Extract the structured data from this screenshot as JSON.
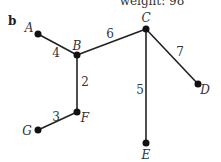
{
  "caption": "weight: 98",
  "panel_label": "b",
  "graph": {
    "nodes": [
      {
        "id": "A",
        "x": 38,
        "y": 34,
        "lx": 29,
        "ly": 32
      },
      {
        "id": "B",
        "x": 77,
        "y": 55,
        "lx": 77,
        "ly": 50
      },
      {
        "id": "C",
        "x": 146,
        "y": 29,
        "lx": 146,
        "ly": 22
      },
      {
        "id": "D",
        "x": 198,
        "y": 84,
        "lx": 205,
        "ly": 94
      },
      {
        "id": "E",
        "x": 146,
        "y": 143,
        "lx": 146,
        "ly": 159
      },
      {
        "id": "F",
        "x": 77,
        "y": 112,
        "lx": 85,
        "ly": 122
      },
      {
        "id": "G",
        "x": 38,
        "y": 130,
        "lx": 27,
        "ly": 135
      }
    ],
    "edges": [
      {
        "from": "A",
        "to": "B",
        "weight": "4",
        "wx": 56,
        "wy": 57
      },
      {
        "from": "B",
        "to": "C",
        "weight": "6",
        "wx": 110,
        "wy": 38
      },
      {
        "from": "B",
        "to": "F",
        "weight": "2",
        "wx": 85,
        "wy": 86
      },
      {
        "from": "C",
        "to": "D",
        "weight": "7",
        "wx": 180,
        "wy": 56
      },
      {
        "from": "C",
        "to": "E",
        "weight": "5",
        "wx": 140,
        "wy": 94
      },
      {
        "from": "F",
        "to": "G",
        "weight": "3",
        "wx": 56,
        "wy": 121
      }
    ]
  }
}
